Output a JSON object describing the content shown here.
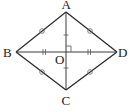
{
  "diagram": {
    "type": "geometry",
    "shape": "rhombus",
    "vertices": {
      "A": "A",
      "B": "B",
      "C": "C",
      "D": "D"
    },
    "center": "O",
    "sides": [
      "AB",
      "BC",
      "CD",
      "DA"
    ],
    "diagonals": [
      "AC",
      "BD"
    ],
    "markings": {
      "equal_sides_marker": "circle",
      "equal_half_BD_marker": "double-tick",
      "equal_half_AC_marker": "single-tick",
      "right_angle_at": "O"
    },
    "colors": {
      "line": "#2a2a2a",
      "background": "#ffffff"
    }
  }
}
